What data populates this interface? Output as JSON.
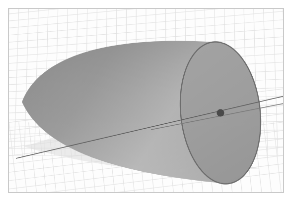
{
  "figure": {
    "title": "",
    "background_color": "#ffffff",
    "frame_color": "#c9c9c9",
    "panel_color": "#fdfdfd",
    "width": 292,
    "height": 205
  },
  "chart_data": {
    "type": "scatter",
    "title": "",
    "subtitle": "",
    "xlabel": "",
    "ylabel": "",
    "zlabel": "",
    "projection": "3d",
    "grid": true,
    "legend": null,
    "legend_position": "none",
    "xlim": [
      -1,
      1
    ],
    "ylim": [
      -1,
      1
    ],
    "zlim": [
      0,
      2
    ],
    "xticks": [],
    "yticks": [],
    "zticks": [],
    "surfaces": [
      {
        "name": "cone-body",
        "shape": "cone",
        "shading": "smooth-gray",
        "facecolor_light": "#b6b6b6",
        "facecolor_dark": "#8d8d8d",
        "edgecolor": "none",
        "apex_px": [
          22,
          103
        ],
        "base_center_px": [
          222,
          114
        ],
        "base_semi_major_px": 72,
        "base_semi_minor_px": 40,
        "base_tilt_deg": -6
      },
      {
        "name": "cone-cap",
        "shape": "ellipse-face",
        "facecolor": "#9d9d9d",
        "edgecolor": "#6a6a6a",
        "edgewidth_px": 1.2,
        "opacity": 0.95
      },
      {
        "name": "floor-shadow",
        "shape": "projected-shadow",
        "facecolor": "#dcdcdc",
        "edgecolor": "none",
        "opacity": 0.55
      }
    ],
    "lines": [
      {
        "name": "axis-line-main",
        "color": "#5c5c5c",
        "width_px": 1,
        "points_px": [
          [
            16,
            160
          ],
          [
            286,
            97
          ]
        ]
      },
      {
        "name": "axis-line-secondary",
        "color": "#7a7a7a",
        "width_px": 1,
        "points_px": [
          [
            152,
            131
          ],
          [
            288,
            104
          ]
        ]
      }
    ],
    "points": [
      {
        "name": "origin-marker",
        "x_px": 222,
        "y_px": 114,
        "radius_px": 4,
        "color": "#4a4a4a",
        "marker": "o",
        "label": ""
      }
    ],
    "grid_style": {
      "color": "#e0e0e0",
      "width_px": 0.6,
      "x_divisions": 28,
      "y_divisions": 20,
      "planes": [
        "back",
        "left",
        "floor"
      ]
    }
  },
  "icons": {
    "point_marker": "filled-circle-marker"
  }
}
